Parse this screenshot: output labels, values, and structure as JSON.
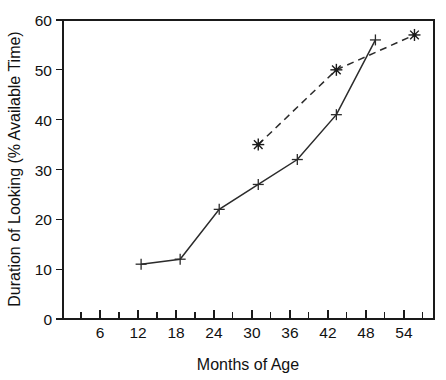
{
  "chart_data": {
    "type": "line",
    "title": "",
    "xlabel": "Months of Age",
    "ylabel": "Duration of Looking (% Available Time)",
    "xlim": [
      0,
      57
    ],
    "ylim": [
      0,
      60
    ],
    "grid": false,
    "legend_position": "none",
    "x_ticks_major": [
      6,
      12,
      18,
      24,
      30,
      36,
      42,
      48,
      54
    ],
    "x_tick_labels": [
      "6",
      "12",
      "18",
      "24",
      "30",
      "36",
      "42",
      "48",
      "54"
    ],
    "x_ticks_minor": [
      3,
      9,
      15,
      21,
      27,
      33,
      39,
      45,
      51
    ],
    "y_ticks": [
      0,
      10,
      20,
      30,
      40,
      50,
      60
    ],
    "y_tick_labels": [
      "0",
      "10",
      "20",
      "30",
      "40",
      "50",
      "60"
    ],
    "series": [
      {
        "name": "solid-series",
        "style": "solid",
        "marker": "plus",
        "color": "#2b2b2b",
        "x": [
          12,
          18,
          24,
          30,
          36,
          42,
          48
        ],
        "values": [
          11,
          12,
          22,
          27,
          32,
          41,
          56
        ]
      },
      {
        "name": "dashed-series",
        "style": "dashed",
        "marker": "star",
        "color": "#1a1a1a",
        "x": [
          30,
          42,
          54
        ],
        "values": [
          35,
          50,
          57
        ]
      }
    ]
  },
  "axes": {
    "y_title": "Duration of Looking (% Available Time)",
    "x_title": "Months of Age",
    "y_labels": {
      "t0": "0",
      "t10": "10",
      "t20": "20",
      "t30": "30",
      "t40": "40",
      "t50": "50",
      "t60": "60"
    },
    "x_labels": {
      "t6": "6",
      "t12": "12",
      "t18": "18",
      "t24": "24",
      "t30": "30",
      "t36": "36",
      "t42": "42",
      "t48": "48",
      "t54": "54"
    }
  }
}
